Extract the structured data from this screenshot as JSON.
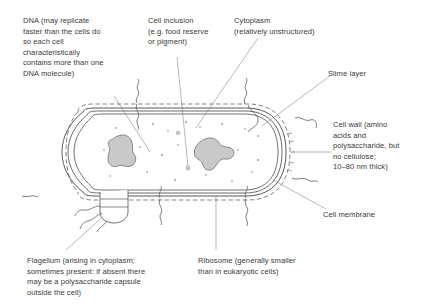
{
  "figure": {
    "background_color": "#ffffff",
    "text_color": "#3a3a3a",
    "line_color": "#55555a",
    "leader_color": "#8a8a90",
    "organelle_fill": "#c9c9c9",
    "organelle_stroke": "#7d7d7d"
  },
  "labels": [
    {
      "id": "dna",
      "name": "dna",
      "text": "DNA (may replicate\nfaster than the cells do\nso each cell\ncharacteristically\ncontains more than one\nDNA molecule)",
      "x": 23,
      "y": 16
    },
    {
      "id": "cell-inclusion",
      "name": "cell-inclusion",
      "text": "Cell inclusion\n(e.g. food reserve\nor pigment)",
      "x": 148,
      "y": 16
    },
    {
      "id": "cytoplasm",
      "name": "cytoplasm",
      "text": "Cytoplasm\n(relatively unstructured)",
      "x": 234,
      "y": 16
    },
    {
      "id": "slime-layer",
      "name": "slime-layer",
      "text": "Slime layer",
      "x": 328,
      "y": 69
    },
    {
      "id": "cell-wall",
      "name": "cell-wall",
      "text": "Cell wall (amino\nacids and\npolysaccharide, but\nno cellulose;\n10–80 nm thick)",
      "x": 333,
      "y": 120
    },
    {
      "id": "cell-membrane",
      "name": "cell-membrane",
      "text": "Cell membrane",
      "x": 323,
      "y": 210
    },
    {
      "id": "flagellum",
      "name": "flagellum",
      "text": "Flagellum (arising in cytoplasm;\nsometimes present: if absent there\nmay be a polysaccharide capsule\noutside the cell)",
      "x": 27,
      "y": 256
    },
    {
      "id": "ribosome",
      "name": "ribosome",
      "text": "Ribosome (generally smaller\nthan in eukaryotic cells)",
      "x": 198,
      "y": 256
    }
  ],
  "structures": {
    "cell_body": "rounded-rectangle-capsule",
    "envelope_layers": [
      "slime-layer-dashed",
      "cell-wall-outer",
      "cell-wall-inner",
      "cell-membrane"
    ],
    "nucleoids": 2,
    "ribosome_dots": 18,
    "flagellum_basal_body": true
  }
}
